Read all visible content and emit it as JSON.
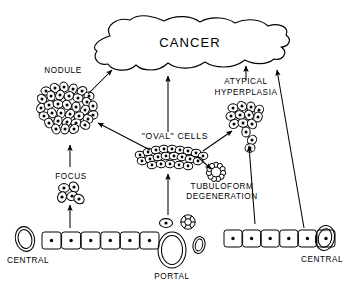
{
  "figure": {
    "type": "diagram",
    "background": "#ffffff",
    "line_color": "#000000"
  },
  "labels": {
    "cancer": "CANCER",
    "nodule": "NODULE",
    "focus": "FOCUS",
    "oval_cells": "\"OVAL\" CELLS",
    "tubuloform_l1": "TUBULOFORM",
    "tubuloform_l2": "DEGENERATION",
    "atypical_l1": "ATYPICAL",
    "atypical_l2": "HYPERPLASIA",
    "central_left": "CENTRAL",
    "central_right": "CENTRAL",
    "portal": "PORTAL"
  },
  "nodes": [
    {
      "id": "cancer",
      "label": "CANCER",
      "shape": "amoeboid-blob",
      "x": 190,
      "y": 45
    },
    {
      "id": "nodule",
      "label": "NODULE",
      "shape": "dense-cell-cluster",
      "x": 68,
      "y": 107,
      "cell_count": 34
    },
    {
      "id": "focus",
      "label": "FOCUS",
      "shape": "small-cell-cluster",
      "x": 70,
      "y": 194,
      "cell_count": 5
    },
    {
      "id": "oval-cells",
      "label": "\"OVAL\" CELLS",
      "shape": "flattened-cell-sheet",
      "x": 172,
      "y": 156,
      "cell_count": 21
    },
    {
      "id": "tubuloform-degeneration",
      "label": "TUBULOFORM DEGENERATION",
      "shape": "cell-ring",
      "x": 216,
      "y": 172,
      "cell_count": 11
    },
    {
      "id": "atypical-hyperplasia",
      "label": "ATYPICAL HYPERPLASIA",
      "shape": "irregular-cell-cluster",
      "x": 246,
      "y": 120,
      "cell_count": 14
    },
    {
      "id": "central-vein-left",
      "label": "CENTRAL",
      "shape": "oval-vessel",
      "x": 25,
      "y": 241
    },
    {
      "id": "hepatocyte-row-left",
      "label": "",
      "shape": "hepatocyte-row",
      "x": 98,
      "y": 242,
      "cell_count": 6
    },
    {
      "id": "portal-triad",
      "label": "PORTAL",
      "shape": "portal-triad",
      "x": 172,
      "y": 248
    },
    {
      "id": "hepatocyte-row-right",
      "label": "",
      "shape": "hepatocyte-row",
      "x": 260,
      "y": 240,
      "cell_count": 6
    },
    {
      "id": "central-vein-right",
      "label": "CENTRAL",
      "shape": "oval-vessel",
      "x": 327,
      "y": 239
    }
  ],
  "arrows": [
    {
      "id": "nodule-to-cancer",
      "from": "nodule",
      "to": "cancer",
      "direction": "up-right"
    },
    {
      "id": "ovalcells-to-cancer",
      "from": "oval-cells",
      "to": "cancer",
      "direction": "up"
    },
    {
      "id": "atypical-to-cancer",
      "from": "atypical-hyperplasia",
      "to": "cancer",
      "direction": "up"
    },
    {
      "id": "hepatocytes-right-to-cancer",
      "from": "hepatocyte-row-right",
      "to": "cancer",
      "direction": "up-left"
    },
    {
      "id": "ovalcells-to-nodule",
      "from": "oval-cells",
      "to": "nodule",
      "direction": "up-left"
    },
    {
      "id": "focus-to-nodule",
      "from": "focus",
      "to": "nodule",
      "direction": "up"
    },
    {
      "id": "hepatocytes-left-to-focus",
      "from": "hepatocyte-row-left",
      "to": "focus",
      "direction": "up"
    },
    {
      "id": "portal-to-ovalcells",
      "from": "portal-triad",
      "to": "oval-cells",
      "direction": "up"
    },
    {
      "id": "ovalcells-to-tubuloform",
      "from": "oval-cells",
      "to": "tubuloform-degeneration",
      "direction": "down-right"
    },
    {
      "id": "ovalcells-to-atypical",
      "from": "oval-cells",
      "to": "atypical-hyperplasia",
      "direction": "up-right"
    },
    {
      "id": "hepatocytes-right-to-atypical",
      "from": "hepatocyte-row-right",
      "to": "atypical-hyperplasia",
      "direction": "up"
    }
  ]
}
